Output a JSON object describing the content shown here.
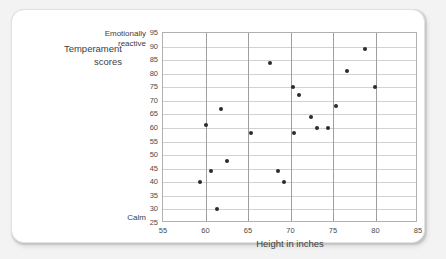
{
  "chart_data": {
    "type": "scatter",
    "title": "",
    "ylabel": "Temperament scores",
    "xlabel": "Height in inches",
    "y_axis_top_label": "Emotionally reactive",
    "y_axis_bottom_label": "Calm",
    "xlim": [
      55,
      85
    ],
    "ylim": [
      25,
      95
    ],
    "x_ticks": [
      55,
      60,
      65,
      70,
      75,
      80,
      85
    ],
    "y_ticks": [
      25,
      30,
      35,
      40,
      45,
      50,
      55,
      60,
      65,
      70,
      75,
      80,
      85,
      90,
      95
    ],
    "grid": true,
    "legend": "none",
    "point_color": "#2b2b2b",
    "points": [
      {
        "x": 59.3,
        "y": 40
      },
      {
        "x": 60.1,
        "y": 61
      },
      {
        "x": 60.6,
        "y": 44
      },
      {
        "x": 61.3,
        "y": 30
      },
      {
        "x": 61.8,
        "y": 67
      },
      {
        "x": 62.5,
        "y": 48
      },
      {
        "x": 65.3,
        "y": 58
      },
      {
        "x": 67.6,
        "y": 84
      },
      {
        "x": 68.5,
        "y": 44
      },
      {
        "x": 69.2,
        "y": 40
      },
      {
        "x": 70.3,
        "y": 75
      },
      {
        "x": 70.4,
        "y": 58
      },
      {
        "x": 71.0,
        "y": 72
      },
      {
        "x": 72.4,
        "y": 64
      },
      {
        "x": 73.1,
        "y": 60
      },
      {
        "x": 74.4,
        "y": 60
      },
      {
        "x": 75.3,
        "y": 68
      },
      {
        "x": 76.7,
        "y": 81
      },
      {
        "x": 78.8,
        "y": 89
      },
      {
        "x": 79.9,
        "y": 75
      }
    ]
  },
  "chart": {
    "ylabel": "Temperament\nscores",
    "ylabel_line1": "Temperament",
    "ylabel_line2": "scores",
    "top_label_line1": "Emotionally",
    "top_label_line2": "reactive",
    "bottom_label": "Calm",
    "xlabel": "Height in inches"
  }
}
